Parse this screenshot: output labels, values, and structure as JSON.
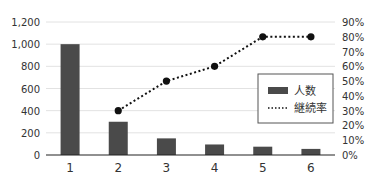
{
  "chart_data": {
    "type": "bar",
    "title": "",
    "categories": [
      "1",
      "2",
      "3",
      "4",
      "5",
      "6"
    ],
    "series": [
      {
        "name": "人数",
        "type": "bar",
        "axis": "left",
        "color": "#4a4a4a",
        "values": [
          1000,
          300,
          150,
          95,
          75,
          55
        ]
      },
      {
        "name": "継続率",
        "type": "line",
        "style": "dotted",
        "axis": "right",
        "color": "#111111",
        "values": [
          null,
          30,
          50,
          60,
          80,
          80
        ]
      }
    ],
    "left_axis": {
      "ticks": [
        "0",
        "200",
        "400",
        "600",
        "800",
        "1,000",
        "1,200"
      ],
      "range": [
        0,
        1200
      ]
    },
    "right_axis": {
      "ticks": [
        "0%",
        "10%",
        "20%",
        "30%",
        "40%",
        "50%",
        "60%",
        "70%",
        "80%",
        "90%"
      ],
      "range": [
        0,
        90
      ]
    },
    "legend": {
      "position": "right-middle",
      "entries": [
        "人数",
        "継続率"
      ]
    },
    "grid": true
  }
}
